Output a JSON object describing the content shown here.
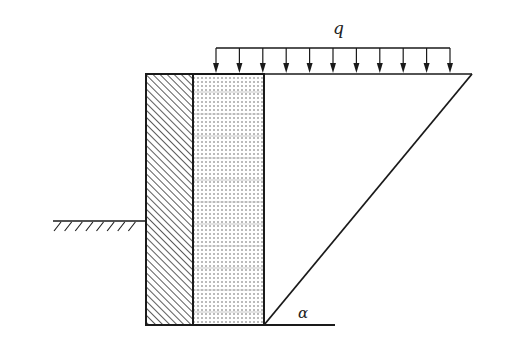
{
  "figure": {
    "width": 507,
    "height": 345,
    "colors": {
      "line": "#1a1a1a",
      "hatch": "#333333",
      "dots": "#555555",
      "background": "#ffffff"
    }
  },
  "labels": {
    "load": "q",
    "angle": "α"
  },
  "geometry": {
    "wall": {
      "x": 146,
      "y": 74,
      "width": 47,
      "height": 251
    },
    "backfill": {
      "x": 193,
      "y": 74,
      "width": 71,
      "height": 251
    },
    "top_surface": {
      "x1": 146,
      "y1": 74,
      "x2": 472,
      "y2": 74
    },
    "slip_line": {
      "x1": 264,
      "y1": 325,
      "x2": 472,
      "y2": 74
    },
    "base_line": {
      "x1": 146,
      "y1": 325,
      "x2": 335,
      "y2": 325
    },
    "ground_surface": {
      "x1": 53,
      "y1": 221,
      "x2": 146,
      "y2": 221,
      "hatch_count": 8
    },
    "load": {
      "frame_y": 48,
      "arrow_tip_y": 73,
      "x_start": 216,
      "x_end": 450,
      "arrow_count": 11
    },
    "load_label_pos": {
      "x": 333,
      "y": 34
    },
    "angle_label_pos": {
      "x": 298,
      "y": 318
    }
  }
}
